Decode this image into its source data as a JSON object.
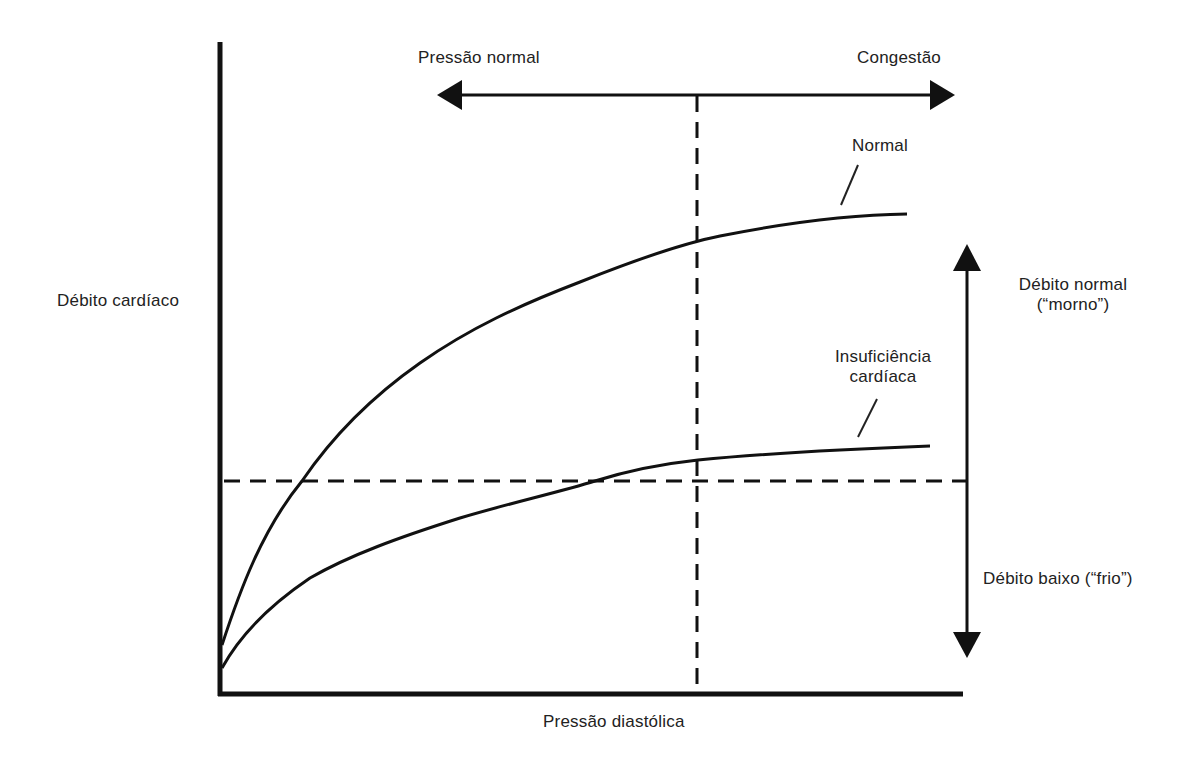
{
  "diagram": {
    "type": "cardiac function curves (Frank-Starling)",
    "axes": {
      "y_label": "Débito cardíaco",
      "x_label": "Pressão diastólica"
    },
    "top_arrow": {
      "left_label": "Pressão normal",
      "right_label": "Congestão"
    },
    "right_arrow": {
      "upper_label_line1": "Débito normal",
      "upper_label_line2": "(“morno”)",
      "lower_label": "Débito baixo (“frio”)"
    },
    "curves": [
      {
        "name": "Normal",
        "label": "Normal",
        "points_px": [
          [
            222,
            645
          ],
          [
            262,
            560
          ],
          [
            302,
            481
          ],
          [
            330,
            440
          ],
          [
            420,
            363
          ],
          [
            550,
            292
          ],
          [
            697,
            240
          ],
          [
            800,
            222
          ],
          [
            907,
            214
          ]
        ]
      },
      {
        "name": "Insuficiência cardíaca",
        "label_line1": "Insuficiência",
        "label_line2": "cardíaca",
        "points_px": [
          [
            222,
            668
          ],
          [
            280,
            600
          ],
          [
            400,
            537
          ],
          [
            595,
            481
          ],
          [
            698,
            460
          ],
          [
            820,
            451
          ],
          [
            930,
            446
          ]
        ]
      }
    ],
    "reference_lines": {
      "horizontal_dashed_y_px": 481,
      "vertical_dashed_x_px": 697
    },
    "colors": {
      "ink": "#111111",
      "text": "#222222",
      "background": "#ffffff"
    }
  }
}
